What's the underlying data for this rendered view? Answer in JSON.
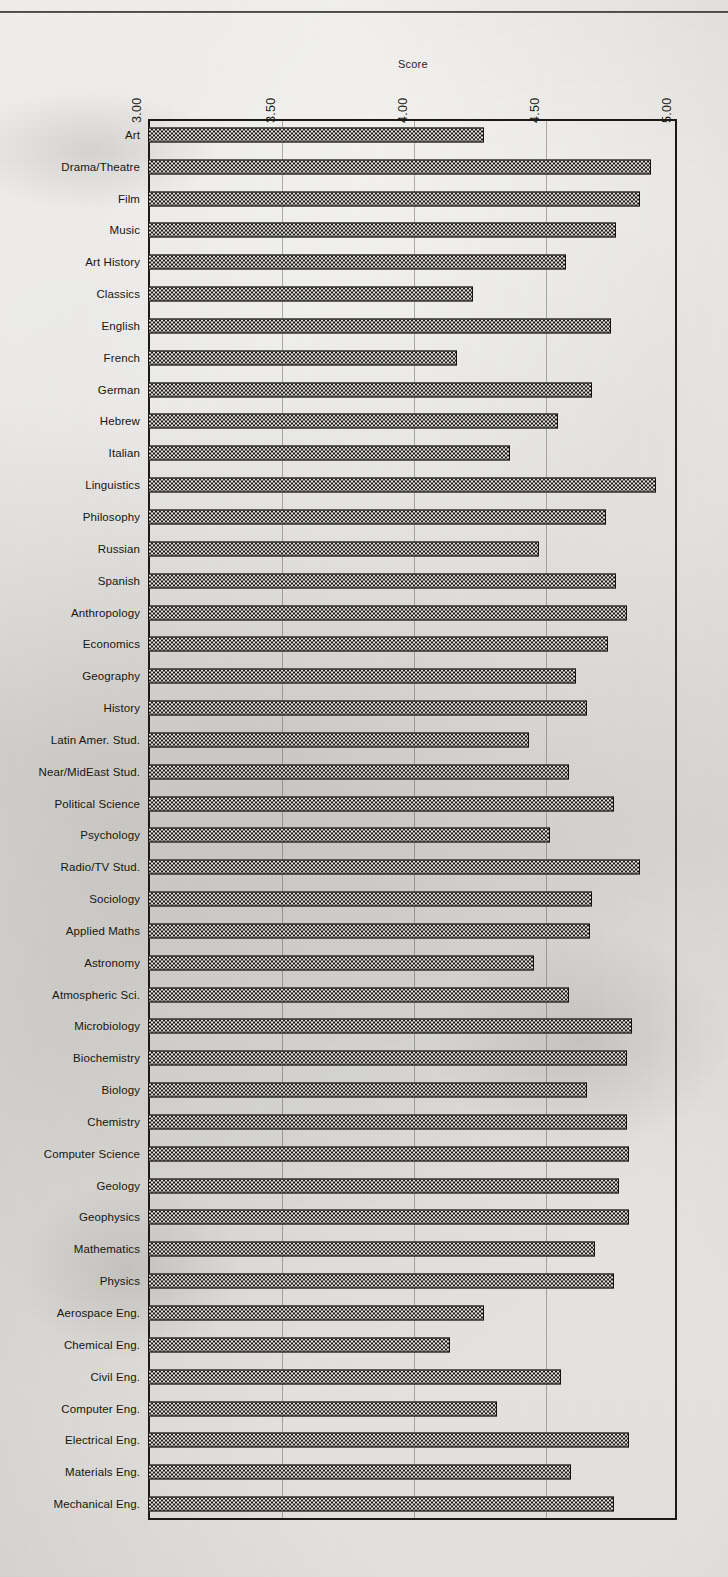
{
  "chart_data": {
    "type": "bar",
    "orientation": "horizontal",
    "title": "",
    "xlabel": "Score",
    "ylabel": "",
    "xlim": [
      3.0,
      5.0
    ],
    "xticks": [
      "3.00",
      "3.50",
      "4.00",
      "4.50",
      "5.00"
    ],
    "xtick_values": [
      3.0,
      3.5,
      4.0,
      4.5,
      5.0
    ],
    "grid": true,
    "legend": null,
    "bar_fill": "checkerboard-hatch",
    "categories": [
      "Art",
      "Drama/Theatre",
      "Film",
      "Music",
      "Art History",
      "Classics",
      "English",
      "French",
      "German",
      "Hebrew",
      "Italian",
      "Linguistics",
      "Philosophy",
      "Russian",
      "Spanish",
      "Anthropology",
      "Economics",
      "Geography",
      "History",
      "Latin Amer. Stud.",
      "Near/MidEast Stud.",
      "Political  Science",
      "Psychology",
      "Radio/TV Stud.",
      "Sociology",
      "Applied Maths",
      "Astronomy",
      "Atmospheric Sci.",
      "Microbiology",
      "Biochemistry",
      "Biology",
      "Chemistry",
      "Computer Science",
      "Geology",
      "Geophysics",
      "Mathematics",
      "Physics",
      "Aerospace Eng.",
      "Chemical Eng.",
      "Civil Eng.",
      "Computer Eng.",
      "Electrical Eng.",
      "Materials  Eng.",
      "Mechanical Eng."
    ],
    "values": [
      4.27,
      4.9,
      4.86,
      4.77,
      4.58,
      4.23,
      4.75,
      4.17,
      4.68,
      4.55,
      4.37,
      4.92,
      4.73,
      4.48,
      4.77,
      4.81,
      4.74,
      4.62,
      4.66,
      4.44,
      4.59,
      4.76,
      4.52,
      4.86,
      4.68,
      4.67,
      4.46,
      4.59,
      4.83,
      4.81,
      4.66,
      4.81,
      4.82,
      4.78,
      4.82,
      4.69,
      4.76,
      4.27,
      4.14,
      4.56,
      4.32,
      4.82,
      4.6,
      4.76
    ]
  },
  "colors": {
    "paper": "#d8d6d2",
    "ink": "#1b1a17",
    "grid": "#3c3a36",
    "bar_dark": "#1a1916",
    "bar_light": "#e4e2de"
  }
}
